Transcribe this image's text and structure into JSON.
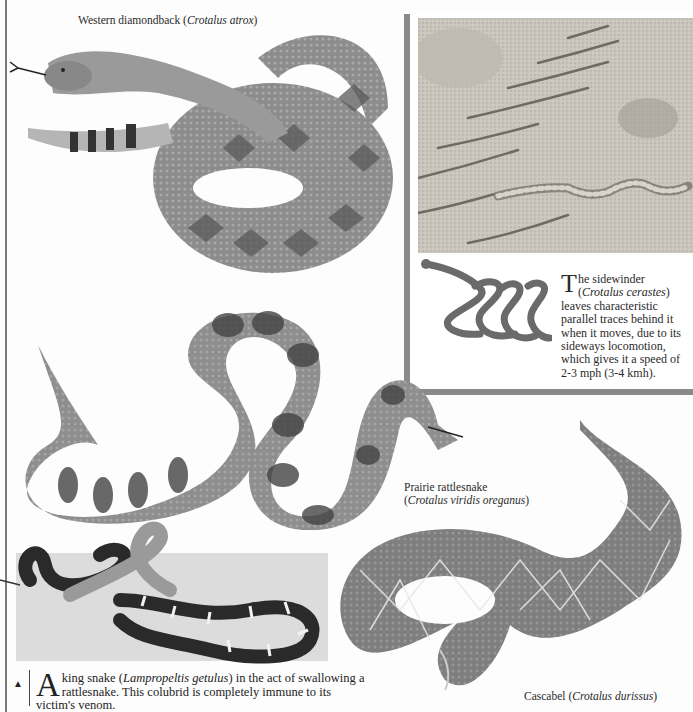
{
  "page": {
    "background": "#fdfdfd",
    "rule_color": "#7a7a7a"
  },
  "figures": {
    "western_diamondback": {
      "common_name": "Western diamondback",
      "scientific_name": "Crotalus atrox"
    },
    "prairie_rattlesnake": {
      "common_name": "Prairie rattlesnake",
      "scientific_name": "Crotalus viridis oreganus"
    },
    "cascabel": {
      "common_name": "Cascabel",
      "scientific_name": "Crotalus durissus"
    },
    "king_snake": {
      "arrow_icon": "triangle-up-icon",
      "dropcap": "A",
      "text_1": " king snake (",
      "scientific_name": "Lampropeltis getulus",
      "text_2": ") in the act of swallowing a rattlesnake. This colubrid is completely immune to its victim's venom."
    }
  },
  "sidewinder_box": {
    "border_color": "#8a8a8a",
    "dropcap": "T",
    "text_1": "he sidewinder (",
    "scientific_name": "Crotalus cerastes",
    "text_2": ") leaves characteristic parallel traces behind it when it moves, due to its sideways locomotion, which gives it a speed of 2-3 mph (3-4 kmh)."
  }
}
